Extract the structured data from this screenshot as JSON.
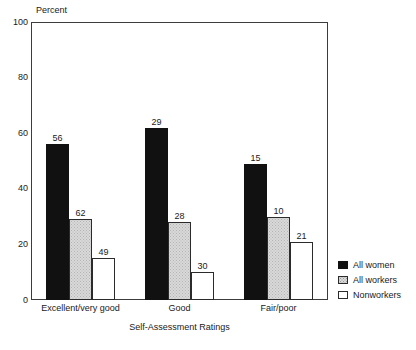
{
  "chart_data": {
    "type": "bar",
    "title": "",
    "subtitle": "",
    "xlabel": "Self-Assessment Ratings",
    "ylabel": "Percent",
    "categories": [
      "Excellent/very good",
      "Good",
      "Fair/poor"
    ],
    "series": [
      {
        "name": "All women",
        "values": [
          56,
          62,
          49
        ]
      },
      {
        "name": "All workers",
        "values": [
          29,
          28,
          30
        ]
      },
      {
        "name": "Nonworkers",
        "values": [
          15,
          10,
          21
        ]
      }
    ],
    "series_by_group": [
      {
        "category": "Excellent/very good",
        "All women": 56,
        "All workers": 62,
        "Nonworkers": 49
      },
      {
        "category": "Good",
        "All women": 29,
        "All workers": 28,
        "Nonworkers": 30
      },
      {
        "category": "Fair/poor",
        "All women": 15,
        "All workers": 10,
        "Nonworkers": 21
      }
    ],
    "ylim": [
      0,
      100
    ],
    "yticks": [
      0,
      20,
      40,
      60,
      80,
      100
    ],
    "ytick_labels": [
      "0",
      "20",
      "40",
      "60",
      "80",
      "100"
    ],
    "grid": false,
    "legend_position": "right",
    "legend_entries": [
      "All women",
      "All workers",
      "Nonworkers"
    ],
    "colors": {
      "all_women": "#111111",
      "all_workers": "#d9d9d9",
      "nonworkers": "#ffffff",
      "outline": "#2b2b2b",
      "axis": "#3c3c3c",
      "text": "#1a1a1a",
      "background": "#ffffff"
    },
    "bar_value_labels": [
      [
        "56",
        "62",
        "49"
      ],
      [
        "29",
        "28",
        "30"
      ],
      [
        "15",
        "10",
        "21"
      ]
    ]
  }
}
